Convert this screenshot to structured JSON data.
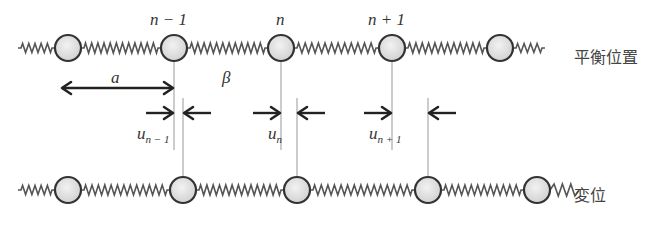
{
  "labels": {
    "mass_top": [
      "n − 1",
      "n",
      "n + 1"
    ],
    "spacing": "a",
    "spring_constant": "β",
    "displacement": [
      {
        "base": "u",
        "sub": "n − 1"
      },
      {
        "base": "u",
        "sub": "n"
      },
      {
        "base": "u",
        "sub": "n + 1"
      }
    ],
    "equilibrium": "平衡位置",
    "displaced": "変位"
  },
  "geometry": {
    "top_row_y": 48,
    "bottom_row_y": 190,
    "radius": 13,
    "top_masses_x": [
      68,
      174,
      281,
      392,
      500
    ],
    "bottom_masses_x": [
      68,
      183,
      297,
      428,
      537
    ],
    "left_end_x": 18,
    "right_end_top_x": 545,
    "right_end_bottom_x": 585
  },
  "colors": {
    "spring": "#555555",
    "mass_fill": "#dddddd",
    "mass_stroke": "#333333",
    "guide_line": "#999999",
    "arrow": "#222222"
  }
}
